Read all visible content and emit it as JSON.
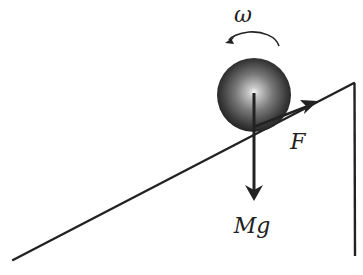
{
  "diagram": {
    "colors": {
      "stroke": "#222222",
      "ball_dark": "#1a1a1a",
      "ball_light": "#f4f4f4",
      "background": "#ffffff"
    },
    "incline": {
      "start": [
        13,
        260
      ],
      "apex": [
        354,
        83
      ],
      "bottom": [
        355,
        256
      ]
    },
    "ball": {
      "cx": 254,
      "cy": 95,
      "r": 37
    },
    "labels": {
      "omega": "ω",
      "friction": "F",
      "weight": "Mg"
    },
    "forces": [
      {
        "name": "weight",
        "label": "Mg",
        "from": [
          254,
          93
        ],
        "to": [
          254,
          200
        ],
        "direction": "down"
      },
      {
        "name": "friction",
        "label": "F",
        "from": [
          255,
          126
        ],
        "to": [
          316,
          102
        ],
        "direction": "up-slope"
      }
    ],
    "rotation": {
      "label": "ω",
      "sense": "counterclockwise"
    }
  }
}
